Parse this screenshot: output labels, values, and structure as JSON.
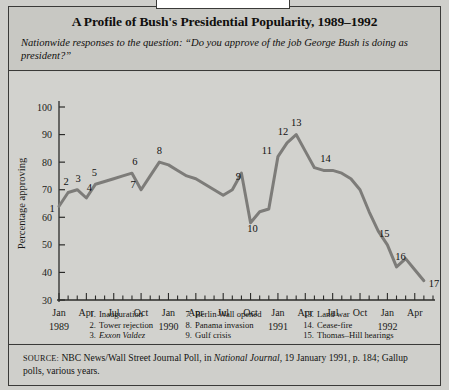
{
  "header": {
    "title": "A Profile of Bush's Presidential Popularity, 1989–1992",
    "subtitle": "Nationwide responses to the question: “Do you approve of the job George Bush is doing as president?”"
  },
  "source": {
    "label": "SOURCE:",
    "text_before_italic": " NBC News/Wall Street Journal Poll, in ",
    "italic": "National Journal,",
    "text_after_italic": " 19 January 1991, p. 184; Gallup polls, various years."
  },
  "legend": {
    "columns": [
      [
        {
          "num": "1.",
          "text": "Inauguration",
          "italic_part": ""
        },
        {
          "num": "2.",
          "text": "Tower rejection",
          "italic_part": ""
        },
        {
          "num": "3.",
          "text": "",
          "italic_part": "Exxon Valdez"
        },
        {
          "num": "4.",
          "text": " tragedy",
          "italic_part": "Iowa"
        },
        {
          "num": "5.",
          "text": "China crisis",
          "italic_part": ""
        },
        {
          "num": "6.",
          "text": "Summit",
          "italic_part": ""
        }
      ],
      [
        {
          "num": "7.",
          "text": "Berlin Wall opened",
          "italic_part": ""
        },
        {
          "num": "8.",
          "text": "Panama invasion",
          "italic_part": ""
        },
        {
          "num": "9.",
          "text": "Gulf crisis",
          "italic_part": ""
        },
        {
          "num": "10.",
          "text": "Blockade",
          "italic_part": ""
        },
        {
          "num": "11.",
          "text": "Armed force authorized",
          "italic_part": ""
        },
        {
          "num": "12.",
          "text": "Bombing begins",
          "italic_part": ""
        }
      ],
      [
        {
          "num": "13.",
          "text": "Land war",
          "italic_part": ""
        },
        {
          "num": "14.",
          "text": "Cease-fire",
          "italic_part": ""
        },
        {
          "num": "15.",
          "text": "Thomas–Hill hearings",
          "italic_part": ""
        },
        {
          "num": "16.",
          "text": "Perot on Larry King",
          "italic_part": ""
        },
        {
          "num": "17.",
          "text": "LA riots",
          "italic_part": ""
        }
      ]
    ]
  },
  "chart_data": {
    "type": "line",
    "title": "A Profile of Bush's Presidential Popularity, 1989–1992",
    "xlabel": "",
    "ylabel": "Percentage approving",
    "ylim": [
      30,
      100
    ],
    "yticks": [
      30,
      40,
      50,
      60,
      70,
      80,
      90,
      100
    ],
    "grid": false,
    "legend_position": "inside-lower-left",
    "line_color": "#7d7c79",
    "x_axis": {
      "start": "1989-01",
      "end": "1992-06",
      "tick_interval_months": 1,
      "major_tick_labels": [
        {
          "date": "1989-01",
          "label": "Jan"
        },
        {
          "date": "1989-04",
          "label": "Apr"
        },
        {
          "date": "1989-07",
          "label": "Jul"
        },
        {
          "date": "1989-10",
          "label": "Oct"
        },
        {
          "date": "1990-01",
          "label": "Jan"
        },
        {
          "date": "1990-04",
          "label": "Apr"
        },
        {
          "date": "1990-07",
          "label": "Jul"
        },
        {
          "date": "1990-10",
          "label": "Oct"
        },
        {
          "date": "1991-01",
          "label": "Jan"
        },
        {
          "date": "1991-04",
          "label": "Apr"
        },
        {
          "date": "1991-07",
          "label": "Jul"
        },
        {
          "date": "1991-10",
          "label": "Oct"
        },
        {
          "date": "1992-01",
          "label": "Jan"
        },
        {
          "date": "1992-04",
          "label": "Apr"
        }
      ],
      "year_labels": [
        {
          "date": "1989-01",
          "label": "1989"
        },
        {
          "date": "1990-01",
          "label": "1990"
        },
        {
          "date": "1991-01",
          "label": "1991"
        },
        {
          "date": "1992-01",
          "label": "1992"
        }
      ]
    },
    "series": [
      {
        "name": "Percentage approving",
        "x": [
          "1989-01",
          "1989-02",
          "1989-03",
          "1989-04",
          "1989-05",
          "1989-06",
          "1989-07",
          "1989-08",
          "1989-09",
          "1989-10",
          "1989-11",
          "1989-12",
          "1990-01",
          "1990-02",
          "1990-03",
          "1990-04",
          "1990-05",
          "1990-06",
          "1990-07",
          "1990-08",
          "1990-09",
          "1990-10",
          "1990-11",
          "1990-12",
          "1991-01",
          "1991-02",
          "1991-03",
          "1991-04",
          "1991-05",
          "1991-06",
          "1991-07",
          "1991-08",
          "1991-09",
          "1991-10",
          "1991-11",
          "1991-12",
          "1992-01",
          "1992-02",
          "1992-03",
          "1992-04",
          "1992-05"
        ],
        "values": [
          64,
          69,
          70,
          67,
          72,
          73,
          74,
          75,
          76,
          70,
          75,
          80,
          79,
          77,
          75,
          74,
          72,
          70,
          68,
          70,
          76,
          58,
          62,
          63,
          82,
          87,
          90,
          84,
          78,
          77,
          77,
          76,
          74,
          70,
          62,
          55,
          50,
          42,
          45,
          41,
          37
        ]
      }
    ],
    "annotations": [
      {
        "id": 1,
        "date": "1989-01",
        "value": 64,
        "label": "1",
        "event": "Inauguration"
      },
      {
        "id": 2,
        "date": "1989-02",
        "value": 69,
        "label": "2",
        "event": "Tower rejection"
      },
      {
        "id": 3,
        "date": "1989-03",
        "value": 70,
        "label": "3",
        "event": "Exxon Valdez"
      },
      {
        "id": 4,
        "date": "1989-04",
        "value": 67,
        "label": "4",
        "event": "Iowa tragedy"
      },
      {
        "id": 5,
        "date": "1989-05",
        "value": 72,
        "label": "5",
        "event": "China crisis"
      },
      {
        "id": 6,
        "date": "1989-09",
        "value": 76,
        "label": "6",
        "event": "Summit"
      },
      {
        "id": 7,
        "date": "1989-10",
        "value": 70,
        "label": "7",
        "event": "Berlin Wall opened"
      },
      {
        "id": 8,
        "date": "1989-12",
        "value": 80,
        "label": "8",
        "event": "Panama invasion"
      },
      {
        "id": 9,
        "date": "1990-09",
        "value": 76,
        "label": "9",
        "event": "Gulf crisis"
      },
      {
        "id": 10,
        "date": "1990-10",
        "value": 58,
        "label": "10",
        "event": "Blockade"
      },
      {
        "id": 11,
        "date": "1991-01",
        "value": 82,
        "label": "11",
        "event": "Armed force authorized"
      },
      {
        "id": 12,
        "date": "1991-02",
        "value": 87,
        "label": "12",
        "event": "Bombing begins"
      },
      {
        "id": 13,
        "date": "1991-03",
        "value": 90,
        "label": "13",
        "event": "Land war"
      },
      {
        "id": 14,
        "date": "1991-06",
        "value": 77,
        "label": "14",
        "event": "Cease-fire"
      },
      {
        "id": 15,
        "date": "1991-12",
        "value": 55,
        "label": "15",
        "event": "Thomas–Hill hearings"
      },
      {
        "id": 16,
        "date": "1992-02",
        "value": 42,
        "label": "16",
        "event": "Perot on Larry King"
      },
      {
        "id": 17,
        "date": "1992-05",
        "value": 37,
        "label": "17",
        "event": "LA riots"
      }
    ]
  }
}
